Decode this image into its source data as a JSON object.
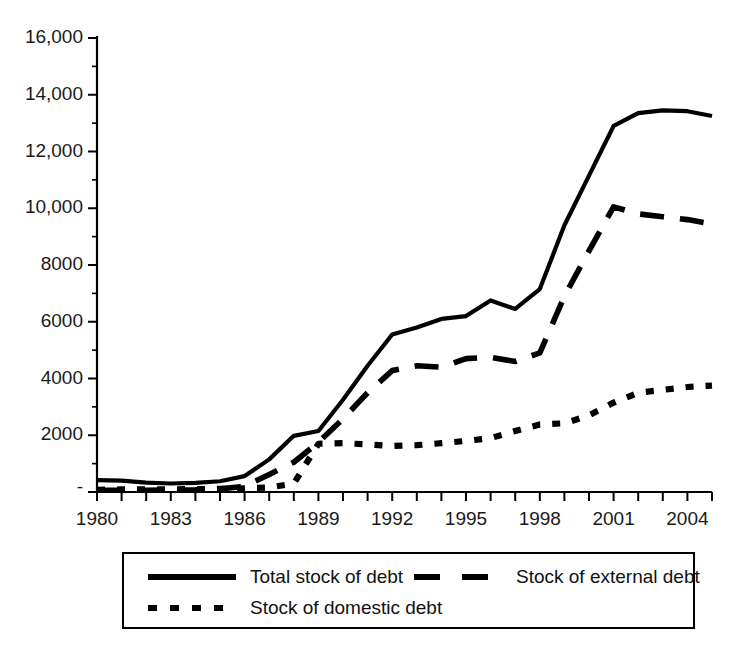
{
  "chart_data": {
    "type": "line",
    "title": "",
    "subtitle": "",
    "xlabel": "",
    "ylabel": "",
    "grid": false,
    "legend_position": "bottom",
    "xlim": [
      1980,
      2005
    ],
    "ylim": [
      0,
      16000
    ],
    "x": [
      1980,
      1981,
      1982,
      1983,
      1984,
      1985,
      1986,
      1987,
      1988,
      1989,
      1990,
      1991,
      1992,
      1993,
      1994,
      1995,
      1996,
      1997,
      1998,
      1999,
      2000,
      2001,
      2002,
      2003,
      2004,
      2005
    ],
    "yticks": [
      0,
      2000,
      4000,
      6000,
      8000,
      10000,
      12000,
      14000,
      16000
    ],
    "ytick_labels": [
      "-",
      "2000",
      "4000",
      "6000",
      "8000",
      "10,000",
      "12,000",
      "14,000",
      "16,000"
    ],
    "xticks": [
      1980,
      1981,
      1982,
      1983,
      1984,
      1985,
      1986,
      1987,
      1988,
      1989,
      1990,
      1991,
      1992,
      1993,
      1994,
      1995,
      1996,
      1997,
      1998,
      1999,
      2000,
      2001,
      2002,
      2003,
      2004,
      2005
    ],
    "xtick_labels": [
      "1980",
      "",
      "",
      "1983",
      "",
      "",
      "1986",
      "",
      "",
      "1989",
      "",
      "",
      "1992",
      "",
      "",
      "1995",
      "",
      "",
      "1998",
      "",
      "",
      "2001",
      "",
      "",
      "2004",
      ""
    ],
    "series": [
      {
        "name": "Total stock of debt",
        "style": "solid",
        "color": "#000000",
        "values": [
          420,
          400,
          330,
          300,
          320,
          380,
          560,
          1150,
          1980,
          2150,
          3250,
          4450,
          5550,
          5800,
          6100,
          6200,
          6750,
          6450,
          7150,
          9400,
          11150,
          12900,
          13350,
          13450,
          13420,
          13250
        ]
      },
      {
        "name": "Stock of external debt",
        "style": "dashed",
        "color": "#000000",
        "values": [
          60,
          60,
          60,
          70,
          80,
          110,
          200,
          620,
          1050,
          1750,
          2580,
          3500,
          4280,
          4450,
          4400,
          4700,
          4750,
          4600,
          4900,
          6900,
          8500,
          10050,
          9800,
          9700,
          9600,
          9450
        ]
      },
      {
        "name": "Stock of domestic debt",
        "style": "dotted",
        "color": "#000000",
        "values": [
          80,
          90,
          90,
          95,
          100,
          110,
          130,
          160,
          300,
          1700,
          1720,
          1680,
          1620,
          1650,
          1720,
          1800,
          1900,
          2150,
          2380,
          2420,
          2700,
          3150,
          3500,
          3600,
          3700,
          3750
        ]
      }
    ]
  },
  "legend": {
    "items": [
      {
        "label": "Total stock of debt",
        "style": "solid"
      },
      {
        "label": "Stock of external debt",
        "style": "dashed"
      },
      {
        "label": "Stock of domestic debt",
        "style": "dotted"
      }
    ]
  }
}
